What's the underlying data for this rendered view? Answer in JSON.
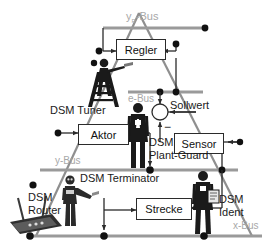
{
  "diagram": {
    "colors": {
      "line_dark": "#2b2b2b",
      "bus_gray": "#9a9a9a",
      "triangle_gray": "#8f8f8f",
      "label_gray": "#a8a8a8",
      "label_dark": "#1a1a1a",
      "background": "#ffffff"
    },
    "buses": [
      {
        "id": "yr-bus",
        "label": "y",
        "sub": "R",
        "suffix": "-Bus"
      },
      {
        "id": "e-bus",
        "label": "e-Bus"
      },
      {
        "id": "y-bus",
        "label": "y-Bus"
      },
      {
        "id": "x-bus",
        "label": "x-Bus"
      }
    ],
    "blocks": [
      {
        "id": "regler",
        "label": "Regler"
      },
      {
        "id": "aktor",
        "label": "Aktor"
      },
      {
        "id": "sensor",
        "label": "Sensor"
      },
      {
        "id": "strecke",
        "label": "Strecke"
      }
    ],
    "signals": [
      {
        "id": "sollwert",
        "label": "Sollwert"
      },
      {
        "id": "sum-minus",
        "label": "−"
      }
    ],
    "agents": [
      {
        "id": "dsm-tuner",
        "label": "DSM Tuner",
        "figure": "person-on-ladder"
      },
      {
        "id": "dsm-plant-guard",
        "label_line1": "DSM",
        "label_line2": "Plant-Guard",
        "figure": "person-standing"
      },
      {
        "id": "dsm-terminator",
        "label": "DSM Terminator",
        "figure": "robot"
      },
      {
        "id": "dsm-router",
        "label_line1": "DSM",
        "label_line2": "Router",
        "figure": "wifi-router"
      },
      {
        "id": "dsm-ident",
        "label_line1": "DSM",
        "label_line2": "Ident",
        "figure": "person-with-clipboard"
      }
    ]
  }
}
